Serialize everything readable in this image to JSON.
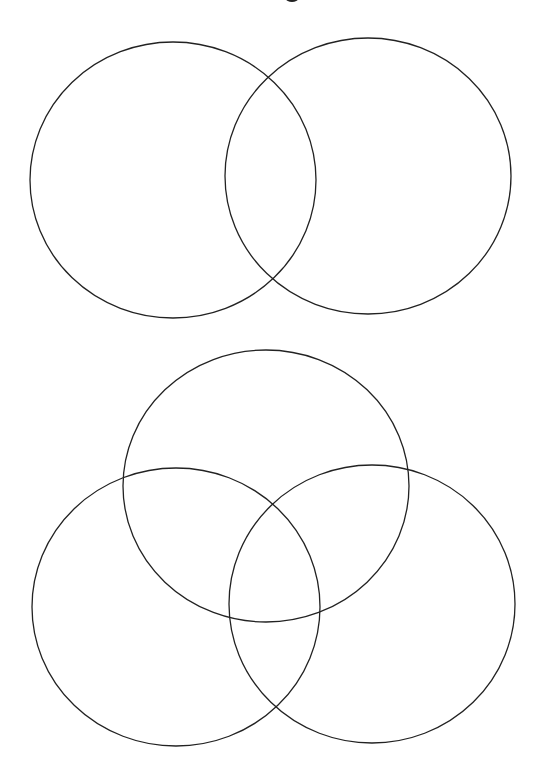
{
  "page": {
    "background": "#ffffff",
    "stroke_color": "#222222",
    "stroke_width": 1.3
  },
  "title_fragment": {
    "visible": true,
    "note": "clipped"
  },
  "diagrams": [
    {
      "name": "two-set-venn",
      "circles": [
        {
          "name": "venn2-circle-left",
          "cx": 173,
          "cy": 180,
          "rx": 143,
          "ry": 138
        },
        {
          "name": "venn2-circle-right",
          "cx": 368,
          "cy": 176,
          "rx": 143,
          "ry": 138
        }
      ]
    },
    {
      "name": "three-set-venn",
      "circles": [
        {
          "name": "venn3-circle-top",
          "cx": 266,
          "cy": 486,
          "rx": 143,
          "ry": 136
        },
        {
          "name": "venn3-circle-bottom-left",
          "cx": 176,
          "cy": 607,
          "rx": 144,
          "ry": 139
        },
        {
          "name": "venn3-circle-bottom-right",
          "cx": 372,
          "cy": 604,
          "rx": 143,
          "ry": 139
        }
      ]
    }
  ]
}
